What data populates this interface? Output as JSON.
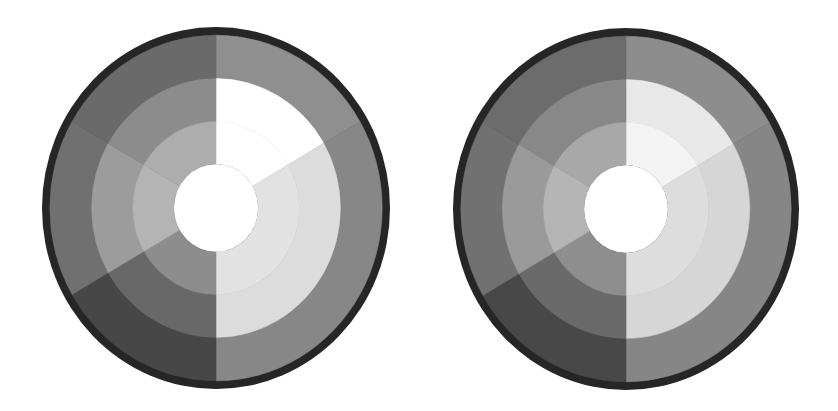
{
  "canvas": {
    "width": 838,
    "height": 411,
    "background": "#ffffff"
  },
  "border_color": "#262626",
  "ring_radii": {
    "outer": 1.0,
    "border_inner": 0.955,
    "ring1_inner": 0.715,
    "ring2_inner": 0.478,
    "hole": 0.242
  },
  "sector_angles_deg_clockwise_from_top": [
    0,
    60,
    180,
    240,
    300,
    360
  ],
  "wheels": [
    {
      "id": "left-wheel",
      "cx": 216,
      "cy": 208,
      "rx": 174,
      "ry": 181,
      "hole_color": "#ffffff",
      "sectors": [
        {
          "from": 0,
          "to": 60,
          "ring1": "#8f8f8f",
          "ring2": "#ffffff",
          "ring3": "#ffffff"
        },
        {
          "from": 60,
          "to": 180,
          "ring1": "#878787",
          "ring2": "#dcdcdc",
          "ring3": "#e2e2e2"
        },
        {
          "from": 180,
          "to": 240,
          "ring1": "#474747",
          "ring2": "#686868",
          "ring3": "#8d8d8d"
        },
        {
          "from": 240,
          "to": 300,
          "ring1": "#707070",
          "ring2": "#9c9c9c",
          "ring3": "#b4b4b4"
        },
        {
          "from": 300,
          "to": 360,
          "ring1": "#6a6a6a",
          "ring2": "#8c8c8c",
          "ring3": "#adadad"
        }
      ]
    },
    {
      "id": "right-wheel",
      "cx": 626,
      "cy": 209,
      "rx": 173,
      "ry": 181,
      "hole_color": "#ffffff",
      "sectors": [
        {
          "from": 0,
          "to": 60,
          "ring1": "#8d8d8d",
          "ring2": "#e8e8e8",
          "ring3": "#f3f3f3"
        },
        {
          "from": 60,
          "to": 180,
          "ring1": "#868686",
          "ring2": "#d6d6d6",
          "ring3": "#dddddd"
        },
        {
          "from": 180,
          "to": 240,
          "ring1": "#484848",
          "ring2": "#6a6a6a",
          "ring3": "#8e8e8e"
        },
        {
          "from": 240,
          "to": 300,
          "ring1": "#717171",
          "ring2": "#9a9a9a",
          "ring3": "#b5b5b5"
        },
        {
          "from": 300,
          "to": 360,
          "ring1": "#6c6c6c",
          "ring2": "#888888",
          "ring3": "#a8a8a8"
        }
      ]
    }
  ]
}
